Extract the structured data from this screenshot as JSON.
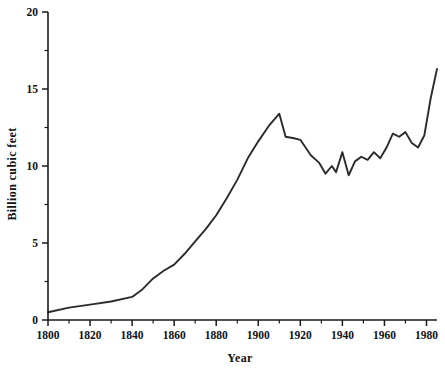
{
  "chart_data": {
    "type": "line",
    "title": "",
    "xlabel": "Year",
    "ylabel": "Billion cubic feet",
    "xlim": [
      1800,
      1985
    ],
    "ylim": [
      0,
      20
    ],
    "grid": false,
    "legend": false,
    "x_ticks": [
      1800,
      1820,
      1840,
      1860,
      1880,
      1900,
      1920,
      1940,
      1960,
      1980
    ],
    "x_tick_labels": [
      "1800",
      "1820",
      "1840",
      "1860",
      "1880",
      "1900",
      "1920",
      "1940",
      "1960",
      "1980"
    ],
    "x_minor_ticks": [
      1810,
      1830,
      1850,
      1870,
      1890,
      1910,
      1930,
      1950,
      1970
    ],
    "y_ticks": [
      0,
      5,
      10,
      15,
      20
    ],
    "y_tick_labels": [
      "0",
      "5",
      "10",
      "15",
      "20"
    ],
    "y_minor_ticks": [
      2.5,
      7.5,
      12.5,
      17.5
    ],
    "series": [
      {
        "name": "Billion cubic feet",
        "color": "#2b2b2b",
        "x": [
          1800,
          1810,
          1820,
          1830,
          1840,
          1845,
          1850,
          1855,
          1860,
          1865,
          1870,
          1875,
          1880,
          1885,
          1890,
          1895,
          1900,
          1905,
          1910,
          1913,
          1917,
          1920,
          1925,
          1929,
          1932,
          1935,
          1937,
          1940,
          1943,
          1946,
          1949,
          1952,
          1955,
          1958,
          1961,
          1964,
          1967,
          1970,
          1973,
          1976,
          1979,
          1982,
          1985
        ],
        "y": [
          0.5,
          0.8,
          1.0,
          1.2,
          1.5,
          2.0,
          2.7,
          3.2,
          3.6,
          4.3,
          5.1,
          5.9,
          6.8,
          7.9,
          9.1,
          10.5,
          11.6,
          12.6,
          13.4,
          11.9,
          11.8,
          11.7,
          10.7,
          10.2,
          9.5,
          10.0,
          9.6,
          10.9,
          9.4,
          10.3,
          10.6,
          10.4,
          10.9,
          10.5,
          11.2,
          12.1,
          11.9,
          12.2,
          11.5,
          11.2,
          12.0,
          14.4,
          16.3
        ]
      }
    ]
  },
  "axes": {
    "y_title": "Billion cubic feet",
    "x_title": "Year"
  }
}
